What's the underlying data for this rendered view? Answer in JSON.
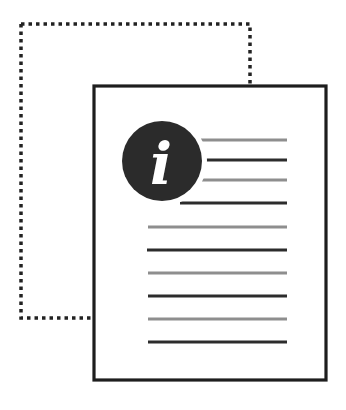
{
  "illustration": {
    "title": "document-info-icon",
    "info_glyph": "i",
    "colors": {
      "background": "#ffffff",
      "outline_dotted": "#222222",
      "document_border": "#1e1e1e",
      "document_fill": "#ffffff",
      "info_circle": "#2b2b2b",
      "info_glyph": "#ffffff",
      "line_dark": "#2c2c2c",
      "line_light": "#8e8e8e"
    },
    "back_page": {
      "x": 21,
      "y": 24,
      "width": 229,
      "height": 294,
      "style": "dotted"
    },
    "front_page": {
      "x": 94,
      "y": 86,
      "width": 232,
      "height": 294
    },
    "info_badge": {
      "cx": 162,
      "cy": 161,
      "r": 40
    },
    "text_lines": [
      {
        "y": 140,
        "x1": 201,
        "x2": 287,
        "tone": "light"
      },
      {
        "y": 160,
        "x1": 206,
        "x2": 287,
        "tone": "dark"
      },
      {
        "y": 180,
        "x1": 202,
        "x2": 287,
        "tone": "light"
      },
      {
        "y": 203,
        "x1": 180,
        "x2": 287,
        "tone": "dark"
      },
      {
        "y": 227,
        "x1": 148,
        "x2": 287,
        "tone": "light"
      },
      {
        "y": 250,
        "x1": 147,
        "x2": 287,
        "tone": "dark"
      },
      {
        "y": 273,
        "x1": 148,
        "x2": 287,
        "tone": "light"
      },
      {
        "y": 296,
        "x1": 148,
        "x2": 287,
        "tone": "dark"
      },
      {
        "y": 319,
        "x1": 148,
        "x2": 287,
        "tone": "light"
      },
      {
        "y": 342,
        "x1": 148,
        "x2": 287,
        "tone": "dark"
      }
    ]
  }
}
